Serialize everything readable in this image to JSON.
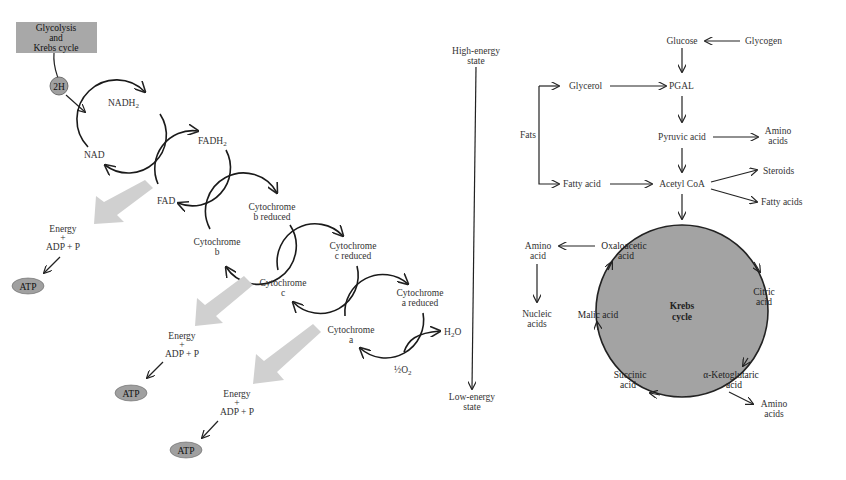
{
  "colors": {
    "box_fill": "#a8a8a8",
    "circle_fill": "#a0a0a0",
    "krebs_fill": "#a3a3a3",
    "big_arrow": "#d0d0d0",
    "line": "#222222",
    "text": "#333333"
  },
  "electron_transport": {
    "source_box": {
      "lines": [
        "Glycolysis",
        "and",
        "Krebs cycle"
      ]
    },
    "hydrogen_badge": "2H",
    "carriers": [
      {
        "oxidized": [
          "NAD"
        ],
        "reduced": [
          "NADH",
          "2"
        ]
      },
      {
        "oxidized": [
          "FAD"
        ],
        "reduced": [
          "FADH",
          "2"
        ]
      },
      {
        "oxidized": [
          "Cytochrome",
          "b"
        ],
        "reduced": [
          "Cytochrome",
          "b reduced"
        ]
      },
      {
        "oxidized": [
          "Cytochrome",
          "c"
        ],
        "reduced": [
          "Cytochrome",
          "c reduced"
        ]
      },
      {
        "oxidized": [
          "Cytochrome",
          "a"
        ],
        "reduced": [
          "Cytochrome",
          "a reduced"
        ]
      }
    ],
    "final_products": {
      "water": "H",
      "water_sub": "2",
      "water_tail": "O",
      "oxygen": "½O",
      "oxygen_sub": "2"
    },
    "energy_sites": [
      {
        "lines": [
          "Energy",
          "+",
          "ADP + P"
        ],
        "product": "ATP"
      },
      {
        "lines": [
          "Energy",
          "+",
          "ADP + P"
        ],
        "product": "ATP"
      },
      {
        "lines": [
          "Energy",
          "+",
          "ADP + P"
        ],
        "product": "ATP"
      }
    ]
  },
  "energy_axis": {
    "top_label": [
      "High-energy",
      "state"
    ],
    "bottom_label": [
      "Low-energy",
      "state"
    ]
  },
  "metabolism": {
    "glucose": "Glucose",
    "glycogen": "Glycogen",
    "glycerol": "Glycerol",
    "pgal": "PGAL",
    "fats": "Fats",
    "pyruvic_acid": "Pyruvic acid",
    "amino_acids_top": [
      "Amino",
      "acids"
    ],
    "fatty_acid": "Fatty acid",
    "acetyl_coa": "Acetyl CoA",
    "steroids": "Steroids",
    "fatty_acids": "Fatty acids",
    "amino_acid_left": [
      "Amino",
      "acid"
    ],
    "nucleic_acids": [
      "Nucleic",
      "acids"
    ],
    "amino_acids_bottom": [
      "Amino",
      "acids"
    ],
    "krebs": {
      "title": [
        "Krebs",
        "cycle"
      ],
      "oxaloacetic": [
        "Oxaloacetic",
        "acid"
      ],
      "citric": [
        "Citric",
        "acid"
      ],
      "malic": "Malic acid",
      "succinic": [
        "Succinic",
        "acid"
      ],
      "ketoglutaric": [
        "α-Ketoglutaric",
        "acid"
      ]
    }
  }
}
